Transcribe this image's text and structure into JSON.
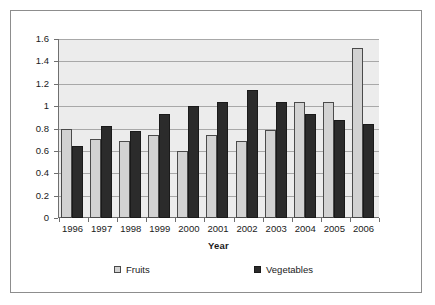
{
  "chart_data": {
    "type": "bar",
    "title": "",
    "xlabel": "Year",
    "ylabel": "Million Tonnes",
    "categories": [
      "1996",
      "1997",
      "1998",
      "1999",
      "2000",
      "2001",
      "2002",
      "2003",
      "2004",
      "2005",
      "2006"
    ],
    "series": [
      {
        "name": "Fruits",
        "color": "#d2d2d2",
        "values": [
          0.8,
          0.71,
          0.69,
          0.74,
          0.6,
          0.74,
          0.69,
          0.79,
          1.04,
          1.04,
          1.52
        ]
      },
      {
        "name": "Vegetables",
        "color": "#2b2b2b",
        "values": [
          0.64,
          0.82,
          0.78,
          0.93,
          1.0,
          1.04,
          1.14,
          1.04,
          0.93,
          0.88,
          0.84
        ]
      }
    ],
    "ylim": [
      0,
      1.6
    ],
    "ytick_step": 0.2,
    "ytick_labels": [
      "0",
      "0.2",
      "0.4",
      "0.6",
      "0.8",
      "1",
      "1.2",
      "1.4",
      "1.6"
    ],
    "grid": "horizontal",
    "legend_position": "bottom",
    "plot_background": "#ececec",
    "axis_color": "#6f6f6f",
    "gridline_color": "#a8a8a8",
    "frame_border_color": "#8d8d8d"
  }
}
